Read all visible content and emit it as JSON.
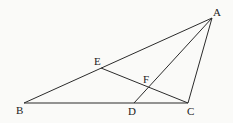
{
  "diagram": {
    "type": "geometry-triangle",
    "background": "#fafaf8",
    "stroke_color": "#2b2b2b",
    "points": {
      "A": {
        "x": 212,
        "y": 18
      },
      "B": {
        "x": 24,
        "y": 103
      },
      "C": {
        "x": 188,
        "y": 103
      },
      "D": {
        "x": 134,
        "y": 103
      },
      "E": {
        "x": 101,
        "y": 68
      },
      "F": {
        "x": 148,
        "y": 87
      }
    },
    "labels": {
      "A": {
        "text": "A",
        "x": 213,
        "y": 16
      },
      "B": {
        "text": "B",
        "x": 16,
        "y": 114
      },
      "C": {
        "text": "C",
        "x": 187,
        "y": 115
      },
      "D": {
        "text": "D",
        "x": 128,
        "y": 115
      },
      "E": {
        "text": "E",
        "x": 94,
        "y": 65
      },
      "F": {
        "text": "F",
        "x": 143,
        "y": 83
      }
    },
    "segments": [
      {
        "from": "A",
        "to": "B"
      },
      {
        "from": "B",
        "to": "C"
      },
      {
        "from": "C",
        "to": "A"
      },
      {
        "from": "A",
        "to": "D"
      },
      {
        "from": "C",
        "to": "E"
      }
    ]
  }
}
